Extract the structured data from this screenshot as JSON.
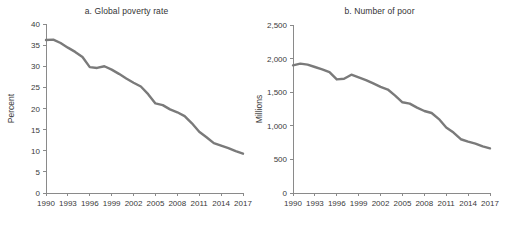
{
  "figure": {
    "background": "#ffffff",
    "line_color": "#7a7a7a",
    "axis_color": "#8a8a8a"
  },
  "chart_data": [
    {
      "type": "line",
      "title": "a. Global poverty rate",
      "xlabel": "",
      "ylabel": "Percent",
      "ylim": [
        0,
        40
      ],
      "yticks": [
        0,
        5,
        10,
        15,
        20,
        25,
        30,
        35,
        40
      ],
      "ytick_labels": [
        "0",
        "5",
        "10",
        "15",
        "20",
        "25",
        "30",
        "35",
        "40"
      ],
      "xlim": [
        1990,
        2017
      ],
      "xticks": [
        1990,
        1993,
        1996,
        1999,
        2002,
        2005,
        2008,
        2011,
        2014,
        2017
      ],
      "xtick_labels": [
        "1990",
        "1993",
        "1996",
        "1999",
        "2002",
        "2005",
        "2008",
        "2011",
        "2014",
        "2017"
      ],
      "grid": false,
      "legend": "none",
      "series": [
        {
          "name": "Global poverty rate",
          "color": "#7a7a7a",
          "x": [
            1990,
            1991,
            1992,
            1993,
            1994,
            1995,
            1996,
            1997,
            1998,
            1999,
            2000,
            2001,
            2002,
            2003,
            2004,
            2005,
            2006,
            2007,
            2008,
            2009,
            2010,
            2011,
            2012,
            2013,
            2014,
            2015,
            2016,
            2017
          ],
          "values": [
            36.2,
            36.3,
            35.5,
            34.4,
            33.4,
            32.2,
            29.8,
            29.6,
            30.0,
            29.2,
            28.2,
            27.1,
            26.1,
            25.2,
            23.4,
            21.2,
            20.8,
            19.8,
            19.1,
            18.2,
            16.5,
            14.5,
            13.2,
            11.8,
            11.2,
            10.6,
            9.9,
            9.3
          ]
        }
      ]
    },
    {
      "type": "line",
      "title": "b. Number of poor",
      "xlabel": "",
      "ylabel": "Millions",
      "ylim": [
        0,
        2500
      ],
      "yticks": [
        0,
        500,
        1000,
        1500,
        2000,
        2500
      ],
      "ytick_labels": [
        "0",
        "500",
        "1,000",
        "1,500",
        "2,000",
        "2,500"
      ],
      "xlim": [
        1990,
        2017
      ],
      "xticks": [
        1990,
        1993,
        1996,
        1999,
        2002,
        2005,
        2008,
        2011,
        2014,
        2017
      ],
      "xtick_labels": [
        "1990",
        "1993",
        "1996",
        "1999",
        "2002",
        "2005",
        "2008",
        "2011",
        "2014",
        "2017"
      ],
      "grid": false,
      "legend": "none",
      "series": [
        {
          "name": "Number of poor",
          "color": "#7a7a7a",
          "x": [
            1990,
            1991,
            1992,
            1993,
            1994,
            1995,
            1996,
            1997,
            1998,
            1999,
            2000,
            2001,
            2002,
            2003,
            2004,
            2005,
            2006,
            2007,
            2008,
            2009,
            2010,
            2011,
            2012,
            2013,
            2014,
            2015,
            2016,
            2017
          ],
          "values": [
            1900,
            1925,
            1910,
            1875,
            1840,
            1800,
            1690,
            1700,
            1760,
            1720,
            1680,
            1630,
            1580,
            1540,
            1450,
            1350,
            1330,
            1270,
            1220,
            1190,
            1100,
            975,
            900,
            800,
            765,
            735,
            695,
            665
          ]
        }
      ]
    }
  ]
}
